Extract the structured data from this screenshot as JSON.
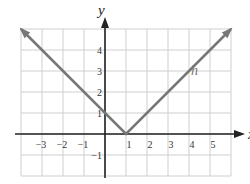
{
  "chart_data": {
    "type": "line",
    "title": "",
    "xlabel": "x",
    "ylabel": "y",
    "xlim": [
      -4,
      6
    ],
    "ylim": [
      -2,
      5
    ],
    "grid": true,
    "x_ticks": [
      -3,
      -2,
      -1,
      1,
      2,
      3,
      4,
      5
    ],
    "x_tick_labels": [
      "−3",
      "−2",
      "−1",
      "1",
      "2",
      "3",
      "4",
      "5"
    ],
    "y_ticks": [
      4,
      3,
      2,
      1,
      -1
    ],
    "y_tick_labels": [
      "4",
      "3",
      "2",
      "1",
      "−1"
    ],
    "series": [
      {
        "name": "h",
        "label": "h",
        "function": "h(x) = |x − 1|",
        "points": [
          [
            -4,
            5
          ],
          [
            1,
            0
          ],
          [
            6,
            5
          ]
        ],
        "arrows": "both-ends",
        "color": "#777777"
      }
    ]
  }
}
